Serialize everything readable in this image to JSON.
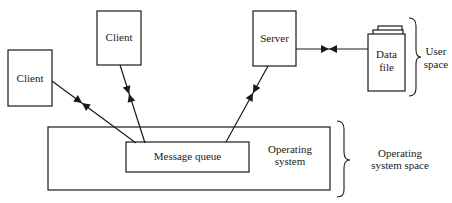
{
  "diagram": {
    "nodes": {
      "client_left": {
        "label": "Client"
      },
      "client_top": {
        "label": "Client"
      },
      "server": {
        "label": "Server"
      },
      "data_file": {
        "line1": "Data",
        "line2": "file"
      },
      "message_queue": {
        "label": "Message queue"
      },
      "operating_system": {
        "line1": "Operating",
        "line2": "system"
      }
    },
    "regions": {
      "user_space": {
        "line1": "User",
        "line2": "space"
      },
      "os_space": {
        "line1": "Operating",
        "line2": "system space"
      }
    },
    "edges": [
      {
        "from": "client_left",
        "to": "message_queue",
        "type": "bidirectional"
      },
      {
        "from": "client_top",
        "to": "message_queue",
        "type": "bidirectional"
      },
      {
        "from": "server",
        "to": "message_queue",
        "type": "bidirectional"
      },
      {
        "from": "server",
        "to": "data_file",
        "type": "bidirectional"
      }
    ],
    "colors": {
      "stroke": "#1a1a1a",
      "background": "#ffffff"
    }
  }
}
